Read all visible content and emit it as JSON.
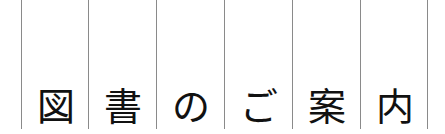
{
  "title": {
    "characters": [
      "図",
      "書",
      "の",
      "ご",
      "案",
      "内"
    ],
    "text": "図書のご案内"
  },
  "colors": {
    "background": "#ffffff",
    "text": "#111111",
    "divider": "#8a8a8a"
  }
}
